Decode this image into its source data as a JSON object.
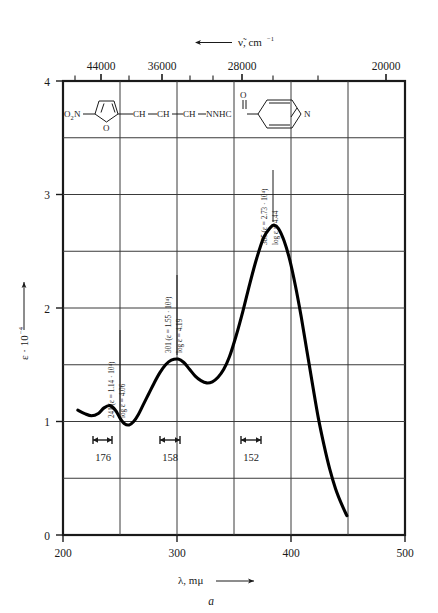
{
  "figure": {
    "panel_letter": "a",
    "top_axis": {
      "title": "ν̃, cm",
      "title_sup": "−1",
      "arrow": "left",
      "tick_labels": [
        "44000",
        "36000",
        "28000",
        "20000"
      ],
      "tick_values": [
        44000,
        36000,
        28000,
        20000
      ]
    },
    "bottom_axis": {
      "title": "λ, mμ",
      "arrow": "right",
      "tick_labels": [
        "200",
        "300",
        "400",
        "500"
      ],
      "tick_values": [
        200,
        300,
        400,
        500
      ]
    },
    "left_axis": {
      "title": "ε · 10",
      "title_sup": "−4",
      "arrow": "up",
      "tick_labels": [
        "0",
        "1",
        "2",
        "3",
        "4"
      ],
      "tick_values": [
        0,
        1,
        2,
        3,
        4
      ]
    },
    "peak_annotations": [
      {
        "line1": "241 (ε = 1.14 · 10⁴)",
        "line2": "log ε = 4.06",
        "lambda": 241,
        "epsilon": 11400,
        "log_epsilon": 4.06
      },
      {
        "line1": "301 (ε = 1.55 · 10⁴)",
        "line2": "log ε = 4.19",
        "lambda": 301,
        "epsilon": 15500,
        "log_epsilon": 4.19
      },
      {
        "line1": "385 (ε = 2.73 · 10⁴)",
        "line2": "log ε = 4.44",
        "lambda": 385,
        "epsilon": 27300,
        "log_epsilon": 4.44
      }
    ],
    "width_markers": [
      {
        "label": "176",
        "lambda": 241
      },
      {
        "label": "158",
        "lambda": 301
      },
      {
        "label": "152",
        "lambda": 385
      }
    ],
    "structure": {
      "nitro": "O",
      "nitro_sub": "2",
      "nitro_n": "N",
      "chain1": "CH",
      "chain2": "CH",
      "chain3": "CH",
      "amide": "NNHC",
      "carbonyl_o": "O",
      "pyridine_n": "N",
      "furan_o": "O",
      "name": "5-nitro-2-furfurylidene isonicotinic acid hydrazide"
    }
  },
  "chart_data": {
    "type": "line",
    "title": "",
    "xlabel": "λ, mμ",
    "ylabel": "ε · 10⁻⁴",
    "xlim": [
      200,
      500
    ],
    "ylim": [
      0,
      4
    ],
    "grid": true,
    "x_ticks": [
      200,
      250,
      300,
      350,
      400,
      450,
      500
    ],
    "x_tick_labels": [
      "200",
      "",
      "300",
      "",
      "400",
      "",
      "500"
    ],
    "y_ticks": [
      0,
      0.5,
      1,
      1.5,
      2,
      2.5,
      3,
      3.5,
      4
    ],
    "y_tick_labels": [
      "0",
      "",
      "1",
      "",
      "2",
      "",
      "3",
      "",
      "4"
    ],
    "secondary_xaxis": {
      "label": "ν̃, cm⁻¹",
      "ticks": [
        44000,
        36000,
        28000,
        20000
      ],
      "relation": "wavenumber = 1e7 / lambda_nm"
    },
    "series": [
      {
        "name": "absorption spectrum",
        "x": [
          213,
          219,
          225,
          231,
          236,
          241,
          246,
          250,
          254,
          258,
          262,
          266,
          270,
          275,
          280,
          285,
          290,
          295,
          301,
          306,
          311,
          316,
          321,
          326,
          331,
          336,
          341,
          346,
          352,
          358,
          364,
          370,
          376,
          382,
          385,
          389,
          394,
          399,
          404,
          409,
          414,
          419,
          424,
          429,
          434,
          439,
          444,
          449
        ],
        "y": [
          1.1,
          1.07,
          1.05,
          1.07,
          1.12,
          1.14,
          1.1,
          1.03,
          0.98,
          0.97,
          1.0,
          1.06,
          1.14,
          1.24,
          1.34,
          1.43,
          1.5,
          1.54,
          1.55,
          1.52,
          1.46,
          1.4,
          1.36,
          1.34,
          1.35,
          1.39,
          1.46,
          1.57,
          1.76,
          1.98,
          2.22,
          2.44,
          2.62,
          2.71,
          2.73,
          2.7,
          2.59,
          2.42,
          2.19,
          1.92,
          1.62,
          1.32,
          1.03,
          0.79,
          0.58,
          0.41,
          0.28,
          0.17
        ],
        "peaks": [
          {
            "lambda": 241,
            "epsilon_x1e4": 1.14,
            "log_epsilon": 4.06,
            "halfwidth": 176
          },
          {
            "lambda": 301,
            "epsilon_x1e4": 1.55,
            "log_epsilon": 4.19,
            "halfwidth": 158
          },
          {
            "lambda": 385,
            "epsilon_x1e4": 2.73,
            "log_epsilon": 4.44,
            "halfwidth": 152
          }
        ]
      }
    ]
  }
}
